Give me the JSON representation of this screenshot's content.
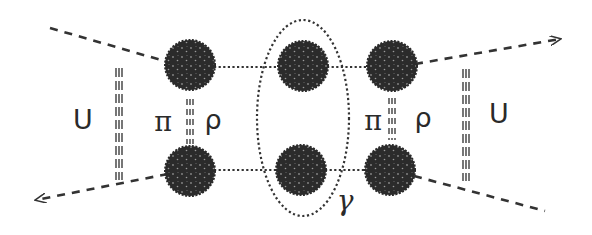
{
  "labels": {
    "left_u": "U",
    "right_u": "U",
    "left_pi": "π",
    "left_rho": "ρ",
    "right_pi": "π",
    "right_rho": "ρ",
    "gamma": "γ"
  },
  "colors": {
    "blob": "#2b2b2b",
    "blob_speckle": "#8a8a8a",
    "line": "#333333",
    "background": "#ffffff"
  },
  "blobs": [
    {
      "id": "top-left",
      "cx": 190,
      "cy": 65,
      "r": 24
    },
    {
      "id": "bottom-left",
      "cx": 190,
      "cy": 171,
      "r": 24
    },
    {
      "id": "top-center",
      "cx": 303,
      "cy": 66,
      "r": 24
    },
    {
      "id": "bottom-center",
      "cx": 301,
      "cy": 170,
      "r": 24
    },
    {
      "id": "top-right",
      "cx": 392,
      "cy": 66,
      "r": 24
    },
    {
      "id": "bottom-right",
      "cx": 390,
      "cy": 170,
      "r": 24
    }
  ]
}
